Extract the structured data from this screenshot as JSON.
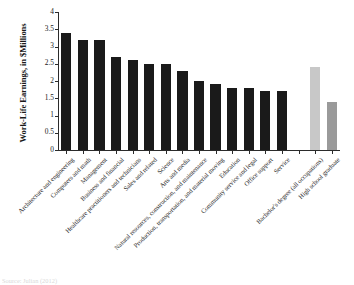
{
  "chart_data": {
    "type": "bar",
    "title": "",
    "xlabel": "",
    "ylabel": "Work-Life Earnings, in $Millions",
    "ylim": [
      0,
      4
    ],
    "ytick_labels": [
      "0",
      "0.5",
      "1",
      "1.5",
      "2",
      "2.5",
      "3",
      "3.5",
      "4"
    ],
    "ytick_values": [
      0,
      0.5,
      1,
      1.5,
      2,
      2.5,
      3,
      3.5,
      4
    ],
    "grid": false,
    "legend": "none",
    "categories": [
      "Architecture and engineering",
      "Computers and math",
      "Management",
      "Business and financial",
      "Healthcare practitioners and technicians",
      "Sales and related",
      "Science",
      "Arts and media",
      "Natural resources, construction, and maintenance",
      "Production, transportation, and material moving",
      "Education",
      "Community service and legal",
      "Office support",
      "Service",
      "",
      "Bachelor's degree (all occupations)",
      "High school graduate"
    ],
    "values": [
      3.4,
      3.2,
      3.2,
      2.7,
      2.6,
      2.5,
      2.5,
      2.3,
      2.0,
      1.9,
      1.8,
      1.8,
      1.7,
      1.7,
      null,
      2.4,
      1.4
    ],
    "bar_colors": [
      "#1a1a1a",
      "#1a1a1a",
      "#1a1a1a",
      "#1a1a1a",
      "#1a1a1a",
      "#1a1a1a",
      "#1a1a1a",
      "#1a1a1a",
      "#1a1a1a",
      "#1a1a1a",
      "#1a1a1a",
      "#1a1a1a",
      "#1a1a1a",
      "#1a1a1a",
      "none",
      "#c8c8c8",
      "#9a9a9a"
    ]
  },
  "source_note": "Source: Julian (2012)"
}
